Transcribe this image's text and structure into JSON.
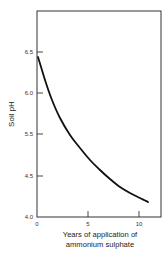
{
  "chart_data": {
    "type": "line",
    "title": "",
    "xlabel": "Years of application of ammonium sulphate",
    "xlabel_lines": [
      "Years of application of",
      "ammonium sulphate"
    ],
    "ylabel": "Soil pH",
    "x_ticks": [
      0,
      5,
      10
    ],
    "x_tick_labels": [
      "0",
      "5",
      "10"
    ],
    "y_tick_labels": [
      "6.5",
      "6.0",
      "5.5",
      "4.5",
      "4.0"
    ],
    "xlim": [
      0,
      12
    ],
    "ylim": [
      4.0,
      7.0
    ],
    "grid": false,
    "legend": null,
    "series": [
      {
        "name": "Soil pH",
        "x": [
          0,
          0.5,
          1,
          2,
          3,
          4,
          5,
          6,
          7,
          8,
          9,
          10,
          10.8
        ],
        "y": [
          6.45,
          6.2,
          6.0,
          5.75,
          5.55,
          5.35,
          5.2,
          5.05,
          4.95,
          4.85,
          4.75,
          4.65,
          4.55
        ]
      }
    ],
    "line_color": "#111111",
    "frame_color": "#333333"
  },
  "pixel_layout": {
    "plot_left": 37,
    "plot_right": 161,
    "plot_top": 11,
    "plot_bottom": 217,
    "y_tick_px": [
      52,
      93,
      134,
      176,
      217
    ],
    "x_tick_px": [
      37,
      88,
      139
    ],
    "curve_px": [
      [
        38,
        57
      ],
      [
        45,
        80
      ],
      [
        52,
        100
      ],
      [
        60,
        118
      ],
      [
        70,
        135
      ],
      [
        80,
        148
      ],
      [
        90,
        160
      ],
      [
        100,
        170
      ],
      [
        110,
        179
      ],
      [
        120,
        187
      ],
      [
        130,
        193
      ],
      [
        140,
        198
      ],
      [
        148,
        202
      ]
    ]
  },
  "labels": {
    "ylabel": "Soil pH",
    "xlabel_line1": "Years of application of",
    "xlabel_line2": "ammonium sulphate"
  }
}
